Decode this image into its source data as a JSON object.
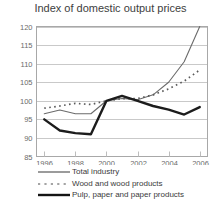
{
  "chart_data": {
    "type": "line",
    "title": "Index of domestic output prices",
    "xlabel": "",
    "ylabel": "",
    "xlim": [
      1995.5,
      2006.5
    ],
    "ylim": [
      85,
      120
    ],
    "yticks": [
      85,
      90,
      95,
      100,
      105,
      110,
      115,
      120
    ],
    "xticks": [
      1996,
      1998,
      2000,
      2002,
      2004,
      2006
    ],
    "xtick_labels": [
      "1996",
      "1998",
      "2000",
      "2002",
      "2004",
      "2006"
    ],
    "ytick_labels": [
      "85",
      "90",
      "95",
      "100",
      "105",
      "110",
      "115",
      "120"
    ],
    "grid": "horizontal",
    "legend_position": "below",
    "x": [
      1996,
      1997,
      1998,
      1999,
      2000,
      2001,
      2002,
      2003,
      2004,
      2005,
      2006
    ],
    "series": [
      {
        "name": "Total industry",
        "style": "solid-thin",
        "color": "#6b6b6b",
        "values": [
          96.5,
          97.5,
          96.5,
          96.5,
          100.0,
          100.6,
          100.3,
          101.6,
          105.0,
          110.5,
          120.0
        ]
      },
      {
        "name": "Wood and wood products",
        "style": "dotted",
        "color": "#5a5a5a",
        "values": [
          98.0,
          98.6,
          99.3,
          99.0,
          100.0,
          100.6,
          100.6,
          101.6,
          103.2,
          105.3,
          108.3
        ]
      },
      {
        "name": "Pulp, paper and paper products",
        "style": "solid-thick",
        "color": "#1c1c1c",
        "values": [
          95.0,
          92.0,
          91.3,
          91.0,
          100.0,
          101.3,
          100.0,
          98.6,
          97.6,
          96.3,
          98.3
        ]
      }
    ]
  },
  "legend": {
    "items": [
      {
        "label": "Total industry",
        "style": "solid-thin"
      },
      {
        "label": "Wood and wood products",
        "style": "dotted"
      },
      {
        "label": "Pulp, paper and paper products",
        "style": "solid-thick"
      }
    ]
  }
}
